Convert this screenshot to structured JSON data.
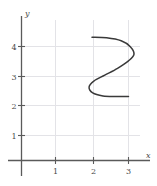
{
  "chart_data": {
    "type": "line",
    "title": "",
    "xlabel": "x",
    "ylabel": "y",
    "xlim": [
      -0.2,
      3.5
    ],
    "ylim": [
      -0.3,
      4.6
    ],
    "grid": true,
    "legend": null,
    "xticks": [
      1,
      2,
      3
    ],
    "xtick_labels": [
      "1",
      "2",
      "3"
    ],
    "yticks": [
      1,
      2,
      3,
      4
    ],
    "ytick_labels": [
      "1",
      "2",
      "3",
      "4"
    ],
    "series": [
      {
        "name": "s-curve",
        "color": "#3a3a3a",
        "description": "Sideways S-shaped curve starting at (2,4), bulging right to about x=3.15 near y=3.5, crossing the middle near (2.5,3), bulging left to about x=1.9 near y=2.4, and ending at (3,2).",
        "endpoints": [
          [
            2,
            4
          ],
          [
            3,
            2
          ]
        ],
        "points": [
          [
            2.0,
            4.0
          ],
          [
            2.4,
            3.98
          ],
          [
            2.8,
            3.88
          ],
          [
            3.05,
            3.68
          ],
          [
            3.15,
            3.42
          ],
          [
            3.0,
            3.2
          ],
          [
            2.7,
            2.95
          ],
          [
            2.35,
            2.72
          ],
          [
            2.05,
            2.52
          ],
          [
            1.92,
            2.32
          ],
          [
            2.02,
            2.12
          ],
          [
            2.3,
            2.02
          ],
          [
            2.65,
            2.0
          ],
          [
            3.0,
            2.0
          ]
        ]
      }
    ]
  },
  "labels": {
    "x_axis": "x",
    "y_axis": "y",
    "x_tick_1": "1",
    "x_tick_2": "2",
    "x_tick_3": "3",
    "y_tick_1": "1",
    "y_tick_2": "2",
    "y_tick_3": "3",
    "y_tick_4": "4"
  },
  "colors": {
    "curve": "#3a3a3a",
    "axis": "#555555",
    "grid": "#e2e2e6",
    "background": "#ffffff",
    "text": "#4a4a4a"
  }
}
